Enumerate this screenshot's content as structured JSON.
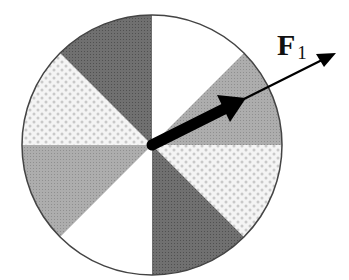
{
  "diagram": {
    "title": "",
    "wheel": {
      "center": [
        152,
        145
      ],
      "radius": 130,
      "sectors": [
        {
          "start_deg": 0,
          "end_deg": 45,
          "fill": "white"
        },
        {
          "start_deg": 45,
          "end_deg": 90,
          "fill": "medium-gray"
        },
        {
          "start_deg": 90,
          "end_deg": 135,
          "fill": "dotted-light"
        },
        {
          "start_deg": 135,
          "end_deg": 180,
          "fill": "dark-gray"
        },
        {
          "start_deg": 180,
          "end_deg": 225,
          "fill": "white"
        },
        {
          "start_deg": 225,
          "end_deg": 270,
          "fill": "medium-gray"
        },
        {
          "start_deg": 270,
          "end_deg": 315,
          "fill": "dotted-light"
        },
        {
          "start_deg": 315,
          "end_deg": 360,
          "fill": "dark-gray"
        }
      ]
    },
    "force_vector": {
      "label_main": "F",
      "label_sub": "1",
      "direction": "up-right"
    },
    "colors": {
      "white": "#ffffff",
      "medium_gray": "#a9a9a9",
      "dark_gray": "#6a6a6a",
      "dotted_bg": "#f4f4f4",
      "dotted_dot": "#c8c8c8",
      "outline": "#444444",
      "arrow": "#000000"
    }
  }
}
